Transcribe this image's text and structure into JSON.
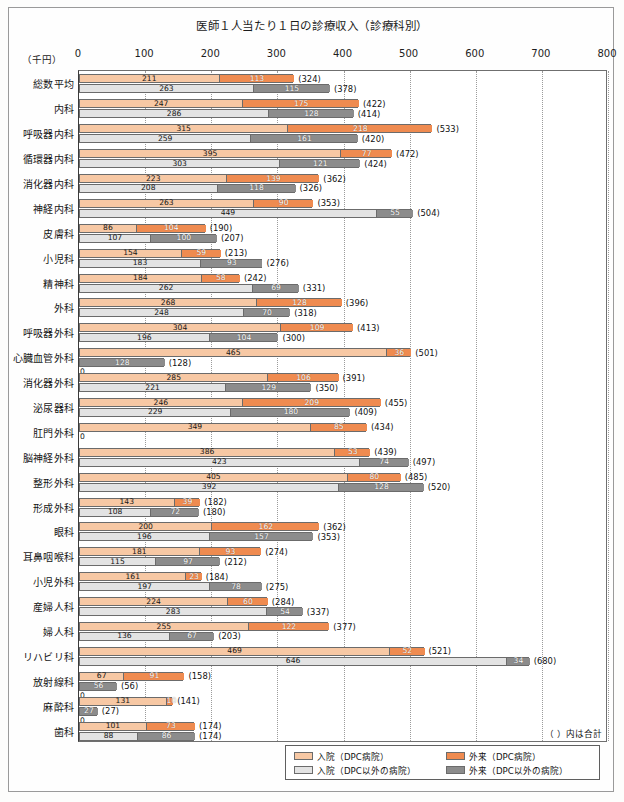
{
  "chart": {
    "title": "医師１人当たり１日の診療収入（診療科別）",
    "unit_label": "（千円）",
    "note": "（ ）内は合計",
    "zero_label": "0"
  },
  "legend": {
    "items": [
      {
        "label": "入院（DPC病院）",
        "color": "#f7c8a4"
      },
      {
        "label": "外来（DPC病院）",
        "color": "#ef8b50"
      },
      {
        "label": "入院（DPC以外の病院）",
        "color": "#e3e3e3"
      },
      {
        "label": "外来（DPC以外の病院）",
        "color": "#8c8c8c"
      }
    ]
  },
  "colors": {
    "dpc_inpatient": "#f7c8a4",
    "dpc_outpatient": "#ef8b50",
    "nondpc_inpatient": "#e3e3e3",
    "nondpc_outpatient": "#8c8c8c",
    "axis": "#3b3b3b",
    "grid": "#9b9b9b"
  },
  "chart_data": {
    "type": "bar",
    "orientation": "horizontal",
    "title": "医師１人当たり１日の診療収入（診療科別）",
    "xlabel": "（千円）",
    "ylabel": "",
    "xlim": [
      0,
      800
    ],
    "xticks": [
      0,
      100,
      200,
      300,
      400,
      500,
      600,
      700,
      800
    ],
    "grid": true,
    "legend_position": "bottom-right",
    "note": "（ ）内は合計",
    "series": [
      {
        "name": "入院（DPC病院）",
        "color": "#f7c8a4"
      },
      {
        "name": "外来（DPC病院）",
        "color": "#ef8b50"
      },
      {
        "name": "入院（DPC以外の病院）",
        "color": "#e3e3e3"
      },
      {
        "name": "外来（DPC以外の病院）",
        "color": "#8c8c8c"
      }
    ],
    "categories": [
      "総数平均",
      "内科",
      "呼吸器内科",
      "循環器内科",
      "消化器内科",
      "神経内科",
      "皮膚科",
      "小児科",
      "精神科",
      "外科",
      "呼吸器外科",
      "心臓血管外科",
      "消化器外科",
      "泌尿器科",
      "肛門外科",
      "脳神経外科",
      "整形外科",
      "形成外科",
      "眼科",
      "耳鼻咽喉科",
      "小児外科",
      "産婦人科",
      "婦人科",
      "リハビリ科",
      "放射線科",
      "麻酔科",
      "歯科"
    ],
    "rows": [
      {
        "category": "総数平均",
        "dpc_inpatient": 211,
        "dpc_outpatient": 113,
        "dpc_total": 324,
        "nondpc_inpatient": 263,
        "nondpc_outpatient": 115,
        "nondpc_total": 378
      },
      {
        "category": "内科",
        "dpc_inpatient": 247,
        "dpc_outpatient": 175,
        "dpc_total": 422,
        "nondpc_inpatient": 286,
        "nondpc_outpatient": 128,
        "nondpc_total": 414
      },
      {
        "category": "呼吸器内科",
        "dpc_inpatient": 315,
        "dpc_outpatient": 218,
        "dpc_total": 533,
        "nondpc_inpatient": 259,
        "nondpc_outpatient": 161,
        "nondpc_total": 420
      },
      {
        "category": "循環器内科",
        "dpc_inpatient": 395,
        "dpc_outpatient": 77,
        "dpc_total": 472,
        "nondpc_inpatient": 303,
        "nondpc_outpatient": 121,
        "nondpc_total": 424
      },
      {
        "category": "消化器内科",
        "dpc_inpatient": 223,
        "dpc_outpatient": 139,
        "dpc_total": 362,
        "nondpc_inpatient": 208,
        "nondpc_outpatient": 118,
        "nondpc_total": 326
      },
      {
        "category": "神経内科",
        "dpc_inpatient": 263,
        "dpc_outpatient": 90,
        "dpc_total": 353,
        "nondpc_inpatient": 449,
        "nondpc_outpatient": 55,
        "nondpc_total": 504
      },
      {
        "category": "皮膚科",
        "dpc_inpatient": 86,
        "dpc_outpatient": 104,
        "dpc_total": 190,
        "nondpc_inpatient": 107,
        "nondpc_outpatient": 100,
        "nondpc_total": 207
      },
      {
        "category": "小児科",
        "dpc_inpatient": 154,
        "dpc_outpatient": 59,
        "dpc_total": 213,
        "nondpc_inpatient": 183,
        "nondpc_outpatient": 93,
        "nondpc_total": 276
      },
      {
        "category": "精神科",
        "dpc_inpatient": 184,
        "dpc_outpatient": 58,
        "dpc_total": 242,
        "nondpc_inpatient": 262,
        "nondpc_outpatient": 69,
        "nondpc_total": 331
      },
      {
        "category": "外科",
        "dpc_inpatient": 268,
        "dpc_outpatient": 128,
        "dpc_total": 396,
        "nondpc_inpatient": 248,
        "nondpc_outpatient": 70,
        "nondpc_total": 318
      },
      {
        "category": "呼吸器外科",
        "dpc_inpatient": 304,
        "dpc_outpatient": 109,
        "dpc_total": 413,
        "nondpc_inpatient": 196,
        "nondpc_outpatient": 104,
        "nondpc_total": 300
      },
      {
        "category": "心臓血管外科",
        "dpc_inpatient": 465,
        "dpc_outpatient": 36,
        "dpc_total": 501,
        "nondpc_inpatient": 0,
        "nondpc_outpatient": 128,
        "nondpc_total": 128
      },
      {
        "category": "消化器外科",
        "dpc_inpatient": 285,
        "dpc_outpatient": 106,
        "dpc_total": 391,
        "nondpc_inpatient": 221,
        "nondpc_outpatient": 129,
        "nondpc_total": 350
      },
      {
        "category": "泌尿器科",
        "dpc_inpatient": 246,
        "dpc_outpatient": 209,
        "dpc_total": 455,
        "nondpc_inpatient": 229,
        "nondpc_outpatient": 180,
        "nondpc_total": 409
      },
      {
        "category": "肛門外科",
        "dpc_inpatient": 349,
        "dpc_outpatient": 85,
        "dpc_total": 434,
        "nondpc_inpatient": 0,
        "nondpc_outpatient": 0,
        "nondpc_total": 0
      },
      {
        "category": "脳神経外科",
        "dpc_inpatient": 386,
        "dpc_outpatient": 53,
        "dpc_total": 439,
        "nondpc_inpatient": 423,
        "nondpc_outpatient": 74,
        "nondpc_total": 497
      },
      {
        "category": "整形外科",
        "dpc_inpatient": 405,
        "dpc_outpatient": 80,
        "dpc_total": 485,
        "nondpc_inpatient": 392,
        "nondpc_outpatient": 128,
        "nondpc_total": 520
      },
      {
        "category": "形成外科",
        "dpc_inpatient": 143,
        "dpc_outpatient": 39,
        "dpc_total": 182,
        "nondpc_inpatient": 108,
        "nondpc_outpatient": 72,
        "nondpc_total": 180
      },
      {
        "category": "眼科",
        "dpc_inpatient": 200,
        "dpc_outpatient": 162,
        "dpc_total": 362,
        "nondpc_inpatient": 196,
        "nondpc_outpatient": 157,
        "nondpc_total": 353
      },
      {
        "category": "耳鼻咽喉科",
        "dpc_inpatient": 181,
        "dpc_outpatient": 93,
        "dpc_total": 274,
        "nondpc_inpatient": 115,
        "nondpc_outpatient": 97,
        "nondpc_total": 212
      },
      {
        "category": "小児外科",
        "dpc_inpatient": 161,
        "dpc_outpatient": 23,
        "dpc_total": 184,
        "nondpc_inpatient": 197,
        "nondpc_outpatient": 78,
        "nondpc_total": 275
      },
      {
        "category": "産婦人科",
        "dpc_inpatient": 224,
        "dpc_outpatient": 60,
        "dpc_total": 284,
        "nondpc_inpatient": 283,
        "nondpc_outpatient": 54,
        "nondpc_total": 337
      },
      {
        "category": "婦人科",
        "dpc_inpatient": 255,
        "dpc_outpatient": 122,
        "dpc_total": 377,
        "nondpc_inpatient": 136,
        "nondpc_outpatient": 67,
        "nondpc_total": 203
      },
      {
        "category": "リハビリ科",
        "dpc_inpatient": 469,
        "dpc_outpatient": 52,
        "dpc_total": 521,
        "nondpc_inpatient": 646,
        "nondpc_outpatient": 34,
        "nondpc_total": 680
      },
      {
        "category": "放射線科",
        "dpc_inpatient": 67,
        "dpc_outpatient": 91,
        "dpc_total": 158,
        "nondpc_inpatient": 0,
        "nondpc_outpatient": 56,
        "nondpc_total": 56
      },
      {
        "category": "麻酔科",
        "dpc_inpatient": 131,
        "dpc_outpatient": 10,
        "dpc_total": 141,
        "nondpc_inpatient": 0,
        "nondpc_outpatient": 27,
        "nondpc_total": 27
      },
      {
        "category": "歯科",
        "dpc_inpatient": 101,
        "dpc_outpatient": 73,
        "dpc_total": 174,
        "nondpc_inpatient": 88,
        "nondpc_outpatient": 86,
        "nondpc_total": 174
      }
    ]
  }
}
